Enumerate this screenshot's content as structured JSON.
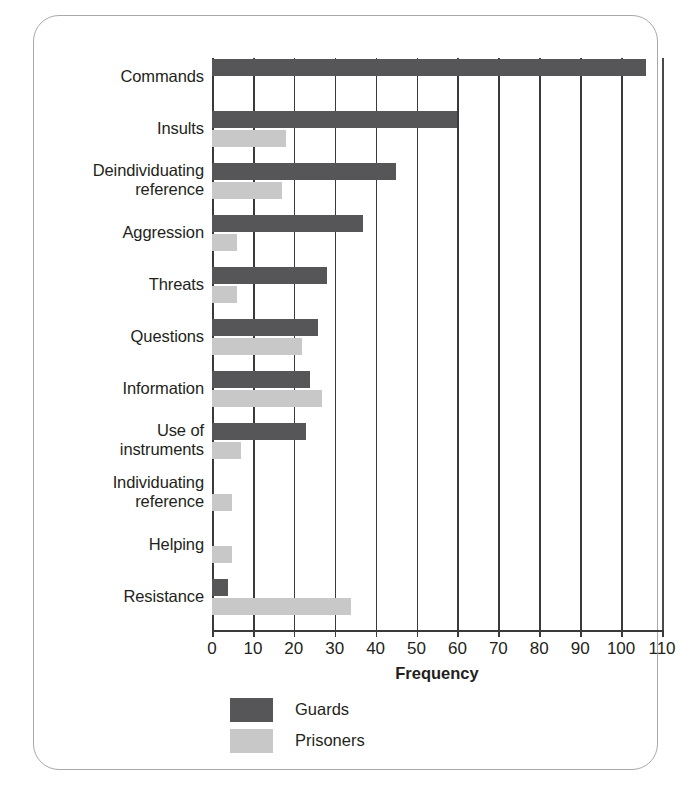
{
  "chart_data": {
    "type": "bar",
    "orientation": "horizontal",
    "title": "",
    "xlabel": "Frequency",
    "ylabel": "",
    "xlim": [
      0,
      110
    ],
    "xticks": [
      0,
      10,
      20,
      30,
      40,
      50,
      60,
      70,
      80,
      90,
      100,
      110
    ],
    "grid": "vertical",
    "legend_position": "bottom-left",
    "categories": [
      "Commands",
      "Insults",
      "Deindividuating reference",
      "Aggression",
      "Threats",
      "Questions",
      "Information",
      "Use of instruments",
      "Individuating reference",
      "Helping",
      "Resistance"
    ],
    "series": [
      {
        "name": "Guards",
        "color": "#565658",
        "values": [
          106,
          60,
          45,
          37,
          28,
          26,
          24,
          23,
          0,
          0,
          4
        ]
      },
      {
        "name": "Prisoners",
        "color": "#c8c8c8",
        "values": [
          0,
          18,
          17,
          6,
          6,
          22,
          27,
          7,
          5,
          5,
          34
        ]
      }
    ]
  },
  "category_labels": [
    {
      "lines": [
        "Commands"
      ]
    },
    {
      "lines": [
        "Insults"
      ]
    },
    {
      "lines": [
        "Deindividuating",
        "reference"
      ]
    },
    {
      "lines": [
        "Aggression"
      ]
    },
    {
      "lines": [
        "Threats"
      ]
    },
    {
      "lines": [
        "Questions"
      ]
    },
    {
      "lines": [
        "Information"
      ]
    },
    {
      "lines": [
        "Use of",
        "instruments"
      ]
    },
    {
      "lines": [
        "Individuating",
        "reference"
      ]
    },
    {
      "lines": [
        "Helping"
      ]
    },
    {
      "lines": [
        "Resistance"
      ]
    }
  ],
  "axis": {
    "x_title": "Frequency",
    "tick_labels": [
      "0",
      "10",
      "20",
      "30",
      "40",
      "50",
      "60",
      "70",
      "80",
      "90",
      "100",
      "110"
    ]
  },
  "legend": {
    "items": [
      {
        "label": "Guards",
        "color": "#565658"
      },
      {
        "label": "Prisoners",
        "color": "#c8c8c8"
      }
    ]
  },
  "colors": {
    "guards": "#565658",
    "prisoners": "#c8c8c8",
    "axis": "#3a3a3a",
    "frame_border": "#a9a9a9",
    "text": "#231f20",
    "background": "#ffffff"
  },
  "caption_remnant": ""
}
